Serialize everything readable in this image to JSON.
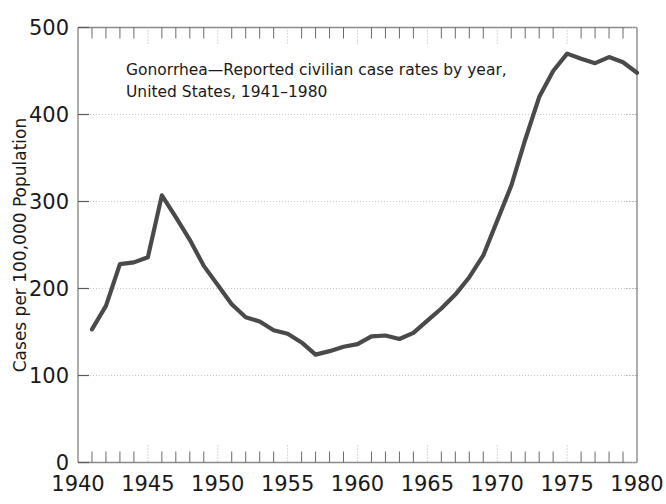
{
  "chart_data": {
    "type": "line",
    "title": "Gonorrhea—Reported civilian case rates by year,",
    "title_line1": "Gonorrhea—Reported civilian case rates by year,",
    "title_line2": "United States, 1941–1980",
    "subtitle": "United States, 1941–1980",
    "xlabel": "",
    "ylabel": "Cases per 100,000 Population",
    "xlim": [
      1940,
      1980
    ],
    "ylim": [
      0,
      500
    ],
    "grid": true,
    "legend_position": "none",
    "line_color": "#4a4a4a",
    "x_ticks": [
      1940,
      1945,
      1950,
      1955,
      1960,
      1965,
      1970,
      1975,
      1980
    ],
    "x_tick_labels": [
      "1940",
      "1945",
      "1950",
      "1955",
      "1960",
      "1965",
      "1970",
      "1975",
      "1980"
    ],
    "x_minor_tick_interval": 1,
    "y_ticks": [
      0,
      100,
      200,
      300,
      400,
      500
    ],
    "y_tick_labels": [
      "0",
      "100",
      "200",
      "300",
      "400",
      "500"
    ],
    "x": [
      1941,
      1942,
      1943,
      1944,
      1945,
      1946,
      1947,
      1948,
      1949,
      1950,
      1951,
      1952,
      1953,
      1954,
      1955,
      1956,
      1957,
      1958,
      1959,
      1960,
      1961,
      1962,
      1963,
      1964,
      1965,
      1966,
      1967,
      1968,
      1969,
      1970,
      1971,
      1972,
      1973,
      1974,
      1975,
      1976,
      1977,
      1978,
      1979,
      1980
    ],
    "values": [
      153,
      180,
      228,
      230,
      236,
      307,
      282,
      256,
      226,
      204,
      182,
      167,
      162,
      152,
      148,
      138,
      124,
      128,
      133,
      136,
      145,
      146,
      142,
      149,
      163,
      177,
      193,
      213,
      238,
      278,
      318,
      371,
      420,
      450,
      470,
      464,
      459,
      466,
      460,
      448
    ],
    "series": [
      {
        "name": "Gonorrhea case rate",
        "values": [
          153,
          180,
          228,
          230,
          236,
          307,
          282,
          256,
          226,
          204,
          182,
          167,
          162,
          152,
          148,
          138,
          124,
          128,
          133,
          136,
          145,
          146,
          142,
          149,
          163,
          177,
          193,
          213,
          238,
          278,
          318,
          371,
          420,
          450,
          470,
          464,
          459,
          466,
          460,
          448
        ]
      }
    ],
    "annotations": []
  }
}
